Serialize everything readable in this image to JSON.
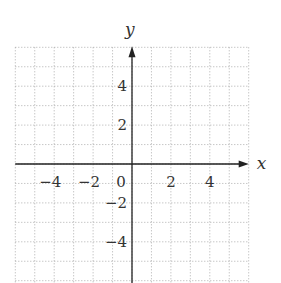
{
  "chart_data": {
    "type": "scatter",
    "title": "",
    "xlabel": "x",
    "ylabel": "y",
    "xlim": [
      -6,
      6
    ],
    "ylim": [
      -6,
      6
    ],
    "grid": true,
    "grid_style": "dotted",
    "grid_step": 1,
    "x_ticks": [
      -4,
      -2,
      0,
      2,
      4
    ],
    "y_ticks": [
      4,
      2,
      -2,
      -4
    ],
    "x_tick_labels": [
      "−4",
      "−2",
      "0",
      "2",
      "4"
    ],
    "y_tick_labels": [
      "4",
      "2",
      "−2",
      "−4"
    ],
    "origin_label": "0",
    "series": [],
    "legend": null
  },
  "colors": {
    "grid": "#9a9a9a",
    "axis": "#222222",
    "text": "#333333",
    "background": "#ffffff"
  }
}
